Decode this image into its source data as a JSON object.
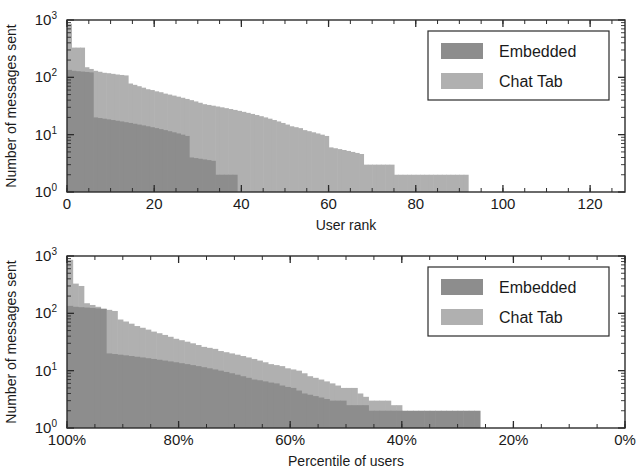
{
  "figure": {
    "background_color": "#ffffff",
    "axis_color": "#2b2b2b",
    "text_color": "#1a1a1a"
  },
  "series_colors": {
    "embedded": "#8d8d8d",
    "chat_tab": "#b0b0b0"
  },
  "legend": {
    "items": [
      {
        "label": "Embedded",
        "color_key": "embedded"
      },
      {
        "label": "Chat Tab",
        "color_key": "chat_tab"
      }
    ]
  },
  "chart_data": [
    {
      "type": "bar",
      "id": "messages-by-user-rank",
      "title": "",
      "xlabel": "User rank",
      "ylabel": "Number of messages sent",
      "xlim": [
        0,
        128
      ],
      "ylim": [
        1,
        1000
      ],
      "yscale": "log",
      "xticks": [
        0,
        20,
        40,
        60,
        80,
        100,
        120
      ],
      "xticklabels": [
        "0",
        "20",
        "40",
        "60",
        "80",
        "100",
        "120"
      ],
      "yticks": [
        1,
        10,
        100,
        1000
      ],
      "yticklabels": [
        "10^0",
        "10^1",
        "10^2",
        "10^3"
      ],
      "ytick_base": "10",
      "ytick_exponents": [
        "0",
        "1",
        "2",
        "3"
      ],
      "grid": false,
      "legend_position": "upper right",
      "series": [
        {
          "name": "Chat Tab",
          "color_key": "chat_tab",
          "x": [
            1,
            2,
            3,
            4,
            5,
            6,
            7,
            8,
            9,
            10,
            11,
            12,
            13,
            14,
            15,
            16,
            17,
            18,
            19,
            20,
            21,
            22,
            23,
            24,
            25,
            26,
            27,
            28,
            29,
            30,
            31,
            32,
            33,
            34,
            35,
            36,
            37,
            38,
            39,
            40,
            41,
            42,
            43,
            44,
            45,
            46,
            47,
            48,
            49,
            50,
            51,
            52,
            53,
            54,
            55,
            56,
            57,
            58,
            59,
            60,
            61,
            62,
            63,
            64,
            65,
            66,
            67,
            68,
            69,
            70,
            71,
            72,
            73,
            74,
            75,
            76,
            77,
            78,
            79,
            80,
            81,
            82,
            83,
            84,
            85,
            86,
            87,
            88,
            89,
            90,
            91,
            92,
            93
          ],
          "values": [
            860,
            330,
            330,
            330,
            150,
            140,
            130,
            125,
            120,
            118,
            115,
            112,
            110,
            108,
            78,
            74,
            70,
            66,
            62,
            60,
            57,
            55,
            52,
            50,
            48,
            46,
            44,
            42,
            40,
            38,
            36,
            34,
            33,
            32,
            31,
            30,
            29,
            28,
            27,
            26,
            25,
            24,
            23,
            22,
            21,
            20,
            19,
            18,
            17,
            16,
            15,
            14,
            13.5,
            13,
            12,
            11.5,
            11,
            10.5,
            10,
            9.5,
            6,
            5.8,
            5.6,
            5.4,
            5.2,
            5,
            4.8,
            4.6,
            3,
            3,
            3,
            3,
            3,
            3,
            3,
            2,
            2,
            2,
            2,
            2,
            2,
            2,
            2,
            2,
            2,
            2,
            2,
            2,
            2,
            2,
            2,
            2
          ]
        },
        {
          "name": "Embedded",
          "color_key": "embedded",
          "x": [
            1,
            2,
            3,
            4,
            5,
            6,
            7,
            8,
            9,
            10,
            11,
            12,
            13,
            14,
            15,
            16,
            17,
            18,
            19,
            20,
            21,
            22,
            23,
            24,
            25,
            26,
            27,
            28,
            29,
            30,
            31,
            32,
            33,
            34,
            35,
            36,
            37,
            38,
            39
          ],
          "values": [
            135,
            130,
            128,
            126,
            124,
            122,
            20,
            19.5,
            19,
            18.5,
            18,
            17.5,
            17,
            16.5,
            16,
            15.5,
            15,
            14.5,
            14,
            13.5,
            13,
            12.5,
            12,
            11.5,
            11,
            10.5,
            10,
            9.5,
            4,
            3.9,
            3.8,
            3.7,
            3.6,
            3.5,
            2,
            2,
            2,
            2,
            2
          ]
        }
      ]
    },
    {
      "type": "bar",
      "id": "messages-by-percentile",
      "title": "",
      "xlabel": "Percentile of users",
      "ylabel": "Number of messages sent",
      "xlim": [
        100,
        0
      ],
      "ylim": [
        1,
        1000
      ],
      "yscale": "log",
      "x_reversed": true,
      "xticks": [
        100,
        80,
        60,
        40,
        20,
        0
      ],
      "xticklabels": [
        "100%",
        "80%",
        "60%",
        "40%",
        "20%",
        "0%"
      ],
      "yticks": [
        1,
        10,
        100,
        1000
      ],
      "yticklabels": [
        "10^0",
        "10^1",
        "10^2",
        "10^3"
      ],
      "ytick_base": "10",
      "ytick_exponents": [
        "0",
        "1",
        "2",
        "3"
      ],
      "grid": false,
      "legend_position": "upper right",
      "series": [
        {
          "name": "Chat Tab",
          "color_key": "chat_tab",
          "x": [
            99.5,
            98.5,
            97.5,
            96.5,
            95.5,
            94.5,
            93.5,
            92.5,
            91.5,
            90.5,
            89.5,
            88.5,
            87.5,
            86.5,
            85.5,
            84.5,
            83.5,
            82.5,
            81.5,
            80.5,
            79.5,
            78.5,
            77.5,
            76.5,
            75.5,
            74.5,
            73.5,
            72.5,
            71.5,
            70.5,
            69.5,
            68.5,
            67.5,
            66.5,
            65.5,
            64.5,
            63.5,
            62.5,
            61.5,
            60.5,
            59.5,
            58.5,
            57.5,
            56.5,
            55.5,
            54.5,
            53.5,
            52.5,
            51.5,
            50.5,
            49.5,
            48.5,
            47.5,
            46.5,
            45.5,
            44.5,
            43.5,
            42.5,
            41.5,
            40.5
          ],
          "values": [
            860,
            330,
            300,
            150,
            140,
            130,
            120,
            115,
            110,
            78,
            72,
            66,
            60,
            56,
            52,
            48,
            45,
            42,
            39,
            36,
            34,
            32,
            30,
            28,
            26,
            25,
            24,
            22,
            21,
            20,
            19,
            18,
            17,
            16,
            15,
            14,
            13,
            12.5,
            12,
            11,
            10.5,
            10,
            9,
            8,
            7.5,
            7,
            6.5,
            6,
            5.5,
            5,
            5,
            5,
            4,
            3.5,
            3,
            3,
            3,
            3,
            2.5,
            2.5
          ]
        },
        {
          "name": "Embedded",
          "color_key": "embedded",
          "x": [
            99.5,
            98.5,
            97.5,
            96.5,
            95.5,
            94.5,
            93.5,
            92.5,
            91.5,
            90.5,
            89.5,
            88.5,
            87.5,
            86.5,
            85.5,
            84.5,
            83.5,
            82.5,
            81.5,
            80.5,
            79.5,
            78.5,
            77.5,
            76.5,
            75.5,
            74.5,
            73.5,
            72.5,
            71.5,
            70.5,
            69.5,
            68.5,
            67.5,
            66.5,
            65.5,
            64.5,
            63.5,
            62.5,
            61.5,
            60.5,
            59.5,
            58.5,
            57.5,
            56.5,
            55.5,
            54.5,
            53.5,
            52.5,
            51.5,
            50.5,
            49.5,
            48.5,
            47.5,
            46.5,
            45.5,
            44.5,
            43.5,
            42.5,
            41.5,
            40.5,
            39.5,
            38.5,
            37.5,
            36.5,
            35.5,
            34.5,
            33.5,
            32.5,
            31.5,
            30.5,
            29.5,
            28.5,
            27.5,
            26.5
          ],
          "values": [
            135,
            130,
            128,
            126,
            124,
            122,
            120,
            20,
            19.5,
            19,
            18.5,
            18,
            17.5,
            17,
            16.5,
            16,
            15.5,
            15,
            14.5,
            14,
            13.5,
            13,
            12.5,
            12,
            11.5,
            11,
            10.5,
            10,
            9.5,
            9,
            8.5,
            8,
            7.5,
            7,
            6.8,
            6.5,
            6.2,
            6,
            5.5,
            5.2,
            5,
            4.5,
            4,
            3.8,
            3.6,
            3.4,
            3.2,
            3,
            3,
            3,
            2.5,
            2.5,
            2.5,
            2.5,
            2,
            2,
            2,
            2,
            2,
            2,
            2,
            2,
            2,
            2,
            2,
            2,
            2,
            2,
            2,
            2,
            2,
            2,
            2,
            2
          ]
        }
      ]
    }
  ]
}
